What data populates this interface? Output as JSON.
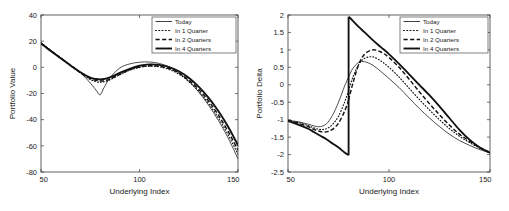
{
  "figure": {
    "name": "portfolio-value-and-delta-figure",
    "background": "#ffffff",
    "foreground": "#1a1a1a"
  },
  "legend_entries": [
    {
      "key": "today",
      "label": "Today",
      "style": "solid-thin"
    },
    {
      "key": "q1",
      "label": "In 1 Quarter",
      "style": "dotted"
    },
    {
      "key": "q2",
      "label": "In 2 Quarters",
      "style": "dashed"
    },
    {
      "key": "q4",
      "label": "In 4 Quarters",
      "style": "solid-thick"
    }
  ],
  "chart_data": [
    {
      "id": "portfolio-value",
      "type": "line",
      "title": "",
      "xlabel": "Underlying Index",
      "ylabel": "Portfolio Value",
      "xlim": [
        50,
        150
      ],
      "ylim": [
        -80,
        40
      ],
      "xticks": [
        50,
        100,
        150
      ],
      "xtick_labels": [
        "50",
        "100",
        "150"
      ],
      "yticks": [
        40,
        20,
        0,
        -20,
        -40,
        -60,
        -80
      ],
      "ytick_labels": [
        "40",
        "20",
        "0",
        "-20",
        "-40",
        "-60",
        "-80"
      ],
      "grid": false,
      "legend_position": "top-right",
      "x": [
        50,
        55,
        60,
        65,
        70,
        75,
        78,
        80,
        82,
        85,
        90,
        95,
        100,
        105,
        110,
        115,
        120,
        125,
        130,
        135,
        140,
        145,
        150
      ],
      "series": [
        {
          "name": "Today",
          "style": "solid-thin",
          "values": [
            19.0,
            13.0,
            7.3,
            1.7,
            -4.0,
            -12.0,
            -17.5,
            -21.0,
            -15.5,
            -8.0,
            -0.5,
            2.6,
            3.9,
            4.1,
            3.0,
            0.4,
            -4.2,
            -10.6,
            -18.8,
            -28.8,
            -40.5,
            -54.0,
            -70.0
          ]
        },
        {
          "name": "In 1 Quarter",
          "style": "dotted",
          "values": [
            18.6,
            12.8,
            7.2,
            1.5,
            -4.2,
            -9.3,
            -11.0,
            -11.4,
            -11.0,
            -9.5,
            -5.6,
            -2.2,
            0.0,
            0.9,
            0.4,
            -1.6,
            -5.2,
            -10.8,
            -18.2,
            -27.5,
            -38.6,
            -51.6,
            -66.4
          ]
        },
        {
          "name": "In 2 Quarters",
          "style": "dashed",
          "values": [
            18.4,
            12.6,
            7.0,
            1.4,
            -4.1,
            -8.6,
            -10.0,
            -10.5,
            -10.2,
            -9.0,
            -5.4,
            -2.0,
            0.3,
            1.2,
            0.8,
            -1.0,
            -4.4,
            -9.7,
            -16.8,
            -25.6,
            -36.4,
            -49.0,
            -63.4
          ]
        },
        {
          "name": "In 4 Quarters",
          "style": "solid-thick",
          "values": [
            18.2,
            12.4,
            6.9,
            1.4,
            -3.8,
            -7.8,
            -8.9,
            -9.2,
            -8.9,
            -7.7,
            -4.3,
            -1.1,
            1.2,
            2.2,
            1.9,
            0.2,
            -3.0,
            -8.0,
            -14.8,
            -23.2,
            -33.4,
            -45.4,
            -59.6
          ]
        }
      ]
    },
    {
      "id": "portfolio-delta",
      "type": "line",
      "title": "",
      "xlabel": "Underlying Index",
      "ylabel": "Portfolio Delta",
      "xlim": [
        50,
        150
      ],
      "ylim": [
        -2.5,
        2
      ],
      "xticks": [
        50,
        100,
        150
      ],
      "xtick_labels": [
        "50",
        "100",
        "150"
      ],
      "yticks": [
        2,
        1.5,
        1,
        0.5,
        0,
        -0.5,
        -1,
        -1.5,
        -2,
        -2.5
      ],
      "ytick_labels": [
        "2",
        "1.5",
        "1",
        "0.5",
        "0",
        "-0.5",
        "-1",
        "-1.5",
        "-2",
        "-2.5"
      ],
      "grid": false,
      "legend_position": "top-right",
      "x": [
        50,
        55,
        60,
        63,
        66,
        69,
        72,
        75,
        78,
        80,
        80.001,
        82,
        85,
        88,
        92,
        96,
        100,
        105,
        110,
        115,
        120,
        125,
        130,
        135,
        140,
        145,
        150
      ],
      "series": [
        {
          "name": "Today",
          "style": "solid-thin",
          "values": [
            -1.02,
            -1.06,
            -1.13,
            -1.18,
            -1.2,
            -1.12,
            -0.88,
            -0.5,
            -0.04,
            0.22,
            0.22,
            0.46,
            0.64,
            0.66,
            0.56,
            0.38,
            0.18,
            -0.08,
            -0.38,
            -0.68,
            -0.95,
            -1.2,
            -1.42,
            -1.6,
            -1.74,
            -1.86,
            -1.95
          ]
        },
        {
          "name": "In 1 Quarter",
          "style": "dotted",
          "values": [
            -1.02,
            -1.08,
            -1.17,
            -1.24,
            -1.28,
            -1.26,
            -1.14,
            -0.9,
            -0.5,
            -0.16,
            -0.16,
            0.2,
            0.58,
            0.76,
            0.8,
            0.68,
            0.5,
            0.22,
            -0.1,
            -0.42,
            -0.72,
            -1.0,
            -1.26,
            -1.48,
            -1.66,
            -1.82,
            -1.94
          ]
        },
        {
          "name": "In 2 Quarters",
          "style": "dashed",
          "values": [
            -1.03,
            -1.1,
            -1.2,
            -1.28,
            -1.34,
            -1.35,
            -1.28,
            -1.1,
            -0.76,
            -0.44,
            -0.44,
            0.02,
            0.58,
            0.88,
            1.0,
            0.94,
            0.78,
            0.5,
            0.16,
            -0.2,
            -0.54,
            -0.86,
            -1.16,
            -1.42,
            -1.62,
            -1.8,
            -1.94
          ]
        },
        {
          "name": "In 4 Quarters",
          "style": "solid-thick",
          "values": [
            -1.04,
            -1.14,
            -1.26,
            -1.36,
            -1.46,
            -1.56,
            -1.68,
            -1.8,
            -1.94,
            -2.02,
            1.95,
            1.84,
            1.66,
            1.5,
            1.28,
            1.08,
            0.88,
            0.6,
            0.3,
            0.0,
            -0.3,
            -0.62,
            -0.96,
            -1.3,
            -1.58,
            -1.8,
            -1.95
          ]
        }
      ]
    }
  ]
}
